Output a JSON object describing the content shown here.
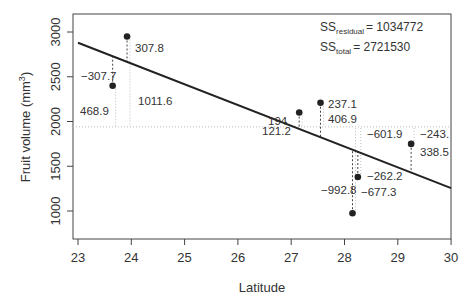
{
  "chart_data": {
    "type": "scatter",
    "title": "",
    "xlabel": "Latitude",
    "ylabel": "Fruit volume (mm",
    "ylabel_superscript": "3",
    "ylabel_close": ")",
    "xlim": [
      23,
      30
    ],
    "ylim": [
      750,
      3250
    ],
    "xticks": [
      23,
      24,
      25,
      26,
      27,
      28,
      29,
      30
    ],
    "yticks": [
      1000,
      1500,
      2000,
      2500,
      3000
    ],
    "grid": false,
    "mean_y": 1940,
    "regression_line": {
      "x": [
        23,
        30
      ],
      "y": [
        2880,
        1255
      ]
    },
    "points": [
      {
        "x": 23.65,
        "y": 2400,
        "residual_label": "-307.7",
        "mean_dev_label": "468.9"
      },
      {
        "x": 23.92,
        "y": 2950,
        "residual_label": "307.8",
        "mean_dev_label": "1011.6"
      },
      {
        "x": 27.15,
        "y": 2100,
        "residual_label": "194",
        "mean_dev_label": "121.2"
      },
      {
        "x": 27.55,
        "y": 2210,
        "residual_label": "237.1",
        "mean_dev_label": "406.9"
      },
      {
        "x": 28.15,
        "y": 975,
        "residual_label": "-677.3",
        "mean_dev_label": "-992.8"
      },
      {
        "x": 28.25,
        "y": 1380,
        "residual_label": "-262.2",
        "mean_dev_label": "-601.9"
      },
      {
        "x": 29.25,
        "y": 1750,
        "residual_label": "338.5",
        "mean_dev_label": "-243."
      }
    ],
    "annotations": {
      "ss_residual_label": "SS",
      "ss_residual_sub": "residual",
      "ss_residual_value": "= 1034772",
      "ss_total_label": "SS",
      "ss_total_sub": "total",
      "ss_total_value": "= 2721530"
    }
  },
  "labels": {
    "x_ticks": [
      "23",
      "24",
      "25",
      "26",
      "27",
      "28",
      "29",
      "30"
    ],
    "y_ticks": [
      "1000",
      "1500",
      "2000",
      "2500",
      "3000"
    ],
    "point_labels": [
      {
        "text": "-307.7",
        "x": 81,
        "y": 80
      },
      {
        "text": "468.9",
        "x": 80,
        "y": 115
      },
      {
        "text": "307.8",
        "x": 135,
        "y": 52
      },
      {
        "text": "1011.6",
        "x": 138,
        "y": 105
      },
      {
        "text": "194",
        "x": 268,
        "y": 125
      },
      {
        "text": "121.2",
        "x": 262,
        "y": 135
      },
      {
        "text": "237.1",
        "x": 328,
        "y": 108
      },
      {
        "text": "406.9",
        "x": 328,
        "y": 123
      },
      {
        "text": "-601.9",
        "x": 367,
        "y": 138
      },
      {
        "text": "-243.",
        "x": 420,
        "y": 138
      },
      {
        "text": "338.5",
        "x": 420,
        "y": 156
      },
      {
        "text": "-262.2",
        "x": 367,
        "y": 180
      },
      {
        "text": "-992.8",
        "x": 321,
        "y": 194
      },
      {
        "text": "-677.3",
        "x": 361,
        "y": 196
      }
    ]
  }
}
